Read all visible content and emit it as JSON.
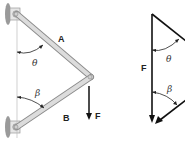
{
  "diagram": {
    "left": {
      "members": [
        {
          "label": "A"
        },
        {
          "label": "B"
        }
      ],
      "force": {
        "label": "F"
      },
      "angles": [
        {
          "symbol": "θ"
        },
        {
          "symbol": "β"
        }
      ]
    },
    "right": {
      "force": {
        "label": "F"
      },
      "angles": [
        {
          "symbol": "θ"
        },
        {
          "symbol": "β"
        }
      ]
    },
    "colors": {
      "member_fill": "#d9d9d9",
      "member_stroke": "#8c8c8c",
      "vector": "#111111",
      "wall": "#a0a0a0"
    }
  }
}
